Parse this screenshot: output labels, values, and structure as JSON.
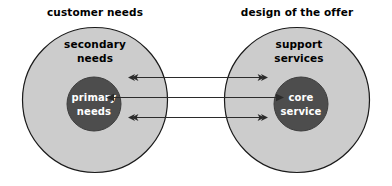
{
  "diagram": {
    "title_left": "customer needs",
    "title_right": "design of the offer",
    "left_group": {
      "outer_label_line1": "secondary",
      "outer_label_line2": "needs",
      "inner_label_line1": "primary",
      "inner_label_line2": "needs"
    },
    "right_group": {
      "outer_label_line1": "support",
      "outer_label_line2": "services",
      "inner_label_line1": "core",
      "inner_label_line2": "service"
    },
    "colors": {
      "background": "#ffffff",
      "outer_circle_fill": "#cccccc",
      "outer_circle_stroke": "#1a1a1a",
      "inner_circle_fill": "#4d4d4d",
      "inner_circle_stroke": "#3d3d3d",
      "arrow_color": "#2b2b2b",
      "heading_text": "#000000",
      "inner_text": "#ffffff"
    },
    "connectors": [
      {
        "name": "top-connector",
        "from": "secondary needs",
        "to": "support services",
        "direction": "bidirectional",
        "y": 77
      },
      {
        "name": "middle-connector",
        "from": "primary needs",
        "to": "core service",
        "direction": "bidirectional",
        "y": 97
      },
      {
        "name": "bottom-connector",
        "from": "secondary needs",
        "to": "support services",
        "direction": "bidirectional",
        "y": 117
      }
    ]
  }
}
